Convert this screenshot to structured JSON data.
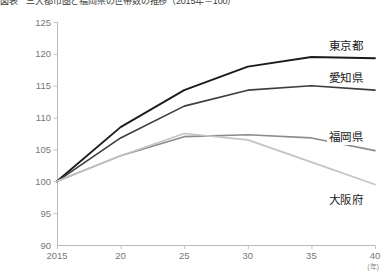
{
  "title": "図表　三大都市圏と福岡県の世帯数の推移（2015年＝100）",
  "axis": {
    "y_ticks": [
      "125",
      "120",
      "115",
      "110",
      "105",
      "100",
      "95",
      "90"
    ],
    "x_ticks": [
      "2015",
      "20",
      "25",
      "30",
      "35",
      "40"
    ],
    "x_unit": "(年)"
  },
  "labels": {
    "tokyo": "東京都",
    "aichi": "愛知県",
    "fukuoka": "福岡県",
    "osaka": "大阪府"
  },
  "colors": {
    "tokyo": "#1c1c1c",
    "aichi": "#3d3d3d",
    "fukuoka": "#8c8c8c",
    "osaka": "#c4c4c4",
    "axis": "#b9b9b9",
    "tick_text": "#777777"
  },
  "chart_data": {
    "type": "line",
    "title": "図表　三大都市圏と福岡県の世帯数の推移（2015年＝100）",
    "xlabel": "(年)",
    "ylabel": "",
    "x": [
      2015,
      2020,
      2025,
      2030,
      2035,
      2040
    ],
    "xtick_labels": [
      "2015",
      "20",
      "25",
      "30",
      "35",
      "40"
    ],
    "xlim": [
      2015,
      2040
    ],
    "ylim": [
      90,
      125
    ],
    "ytick_values": [
      90,
      95,
      100,
      105,
      110,
      115,
      120,
      125
    ],
    "grid": false,
    "legend": "inline-right-end-labels",
    "series": [
      {
        "name": "東京都",
        "color": "#1c1c1c",
        "values": [
          100.0,
          108.5,
          114.3,
          118.0,
          119.5,
          119.3
        ]
      },
      {
        "name": "愛知県",
        "color": "#3d3d3d",
        "values": [
          100.0,
          106.8,
          111.8,
          114.3,
          115.0,
          114.3
        ]
      },
      {
        "name": "福岡県",
        "color": "#8c8c8c",
        "values": [
          100.0,
          104.0,
          107.0,
          107.3,
          106.8,
          104.8
        ]
      },
      {
        "name": "大阪府",
        "color": "#c4c4c4",
        "values": [
          100.0,
          104.0,
          107.5,
          106.5,
          103.0,
          99.5
        ]
      }
    ]
  }
}
